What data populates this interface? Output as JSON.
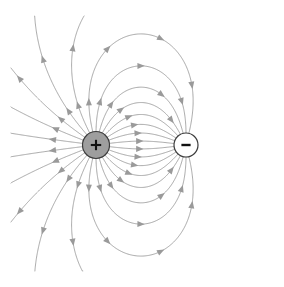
{
  "figure": {
    "type": "vector-field-diagram",
    "width": 284,
    "height": 287,
    "background_color": "#ffffff"
  },
  "style": {
    "field_line_color": "#9c9c9c",
    "field_line_width": 0.9,
    "arrow_color": "#9a9a9a",
    "arrow_size": 4.2,
    "positive_fill": "#9e9e9e",
    "negative_fill": "#ffffff",
    "charge_stroke": "#3c3c3c",
    "glyph_color": "#111111"
  },
  "charges": [
    {
      "id": "positive-charge",
      "label": "+",
      "sign": 1,
      "strength": 1,
      "x": 96,
      "y": 145,
      "radius": 13.5,
      "fill": "#9e9e9e",
      "stroke": "#3c3c3c",
      "glyph": "plus-sign"
    },
    {
      "id": "negative-charge",
      "label": "−",
      "sign": -1,
      "strength": 1,
      "x": 186,
      "y": 145,
      "radius": 12,
      "fill": "#ffffff",
      "stroke": "#3c3c3c",
      "glyph": "minus-sign"
    }
  ],
  "field": {
    "line_count": 26,
    "seed_radius": 13.5,
    "step_size": 0.9,
    "max_steps": 1400,
    "arrow_spacing": 58,
    "first_arrow_at": 30,
    "bounds": {
      "x_min": 11,
      "y_min": 16,
      "x_max": 273,
      "y_max": 271
    }
  },
  "chart_data": {
    "type": "scatter",
    "xlabel": "",
    "ylabel": "",
    "categories": [
      "positive charge",
      "negative charge"
    ],
    "values": [
      1,
      -1
    ],
    "series": [
      {
        "name": "source charge (+)",
        "values": [
          96,
          145
        ]
      },
      {
        "name": "sink charge (−)",
        "values": [
          186,
          145
        ]
      }
    ]
  }
}
